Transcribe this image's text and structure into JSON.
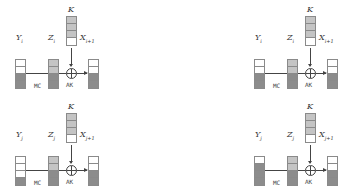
{
  "colors": {
    "white": "#ffffff",
    "light": "#c4c4c4",
    "dark": "#8c8c8c",
    "line": "#444444"
  },
  "panels": [
    {
      "id": "top-left",
      "y_label": "Y",
      "y_sub": "i",
      "z_label": "Z",
      "z_sub": "i",
      "k_label": "K",
      "x_label": "X",
      "x_sub": "i+1",
      "mc_label": "MC",
      "ak_label": "AK",
      "y_cells": [
        "white",
        "white",
        "dark",
        "dark"
      ],
      "z_cells": [
        "light",
        "light",
        "dark",
        "dark"
      ],
      "k_cells": [
        "light",
        "light",
        "light",
        "white"
      ],
      "x_cells": [
        "white",
        "white",
        "dark",
        "dark"
      ]
    },
    {
      "id": "bottom-left",
      "y_label": "Y",
      "y_sub": "j",
      "z_label": "Z",
      "z_sub": "j",
      "k_label": "K",
      "x_label": "X",
      "x_sub": "j+1",
      "mc_label": "MC",
      "ak_label": "AK",
      "y_cells": [
        "white",
        "white",
        "white",
        "dark"
      ],
      "z_cells": [
        "light",
        "light",
        "dark",
        "dark"
      ],
      "k_cells": [
        "light",
        "light",
        "light",
        "white"
      ],
      "x_cells": [
        "white",
        "white",
        "dark",
        "dark"
      ]
    },
    {
      "id": "top-right",
      "y_label": "Y",
      "y_sub": "i",
      "z_label": "Z",
      "z_sub": "i",
      "k_label": "K",
      "x_label": "X",
      "x_sub": "i+1",
      "mc_label": "MC",
      "ak_label": "AK",
      "y_cells": [
        "white",
        "white",
        "dark",
        "dark"
      ],
      "z_cells": [
        "light",
        "light",
        "dark",
        "dark"
      ],
      "k_cells": [
        "light",
        "light",
        "light",
        "white"
      ],
      "x_cells": [
        "white",
        "white",
        "dark",
        "dark"
      ]
    },
    {
      "id": "bottom-right",
      "y_label": "Y",
      "y_sub": "j",
      "z_label": "Z",
      "z_sub": "j",
      "k_label": "K",
      "x_label": "X",
      "x_sub": "j+1",
      "mc_label": "MC",
      "ak_label": "AK",
      "y_cells": [
        "white",
        "dark",
        "dark",
        "dark"
      ],
      "z_cells": [
        "light",
        "light",
        "dark",
        "dark"
      ],
      "k_cells": [
        "light",
        "light",
        "light",
        "white"
      ],
      "x_cells": [
        "white",
        "white",
        "dark",
        "dark"
      ]
    }
  ]
}
